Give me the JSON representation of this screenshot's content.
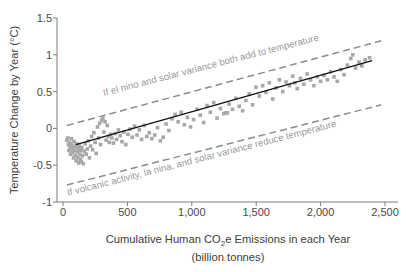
{
  "chart_data": {
    "type": "scatter",
    "title": "",
    "xlabel": "Cumulative Human CO2e Emissions in each Year (billion tonnes)",
    "xlabel_line1": "Cumulative Human CO",
    "xlabel_sub": "2",
    "xlabel_line1b": "e Emissions in each Year",
    "xlabel_line2": "(billion tonnes)",
    "ylabel": "Temperature Change by Year (°C)",
    "xlim": [
      0,
      2500
    ],
    "ylim": [
      -1,
      1.5
    ],
    "xticks": [
      0,
      500,
      1000,
      1500,
      2000,
      2500
    ],
    "xticklabels": [
      "0",
      "500",
      "1,000",
      "1,500",
      "2,000",
      "2,500"
    ],
    "yticks": [
      -1,
      -0.5,
      0,
      0.5,
      1,
      1.5
    ],
    "yticklabels": [
      "-1",
      "-0.5",
      "0",
      "0.5",
      "1",
      "1.5"
    ],
    "grid": false,
    "legend_position": "none",
    "series": [
      {
        "name": "Observed annual temperature change",
        "type": "scatter",
        "marker": "square",
        "color": "#a8a8a8",
        "points": [
          [
            30,
            -0.16
          ],
          [
            38,
            -0.13
          ],
          [
            42,
            -0.22
          ],
          [
            46,
            -0.3
          ],
          [
            50,
            -0.19
          ],
          [
            55,
            -0.26
          ],
          [
            58,
            -0.35
          ],
          [
            62,
            -0.21
          ],
          [
            66,
            -0.14
          ],
          [
            70,
            -0.28
          ],
          [
            74,
            -0.33
          ],
          [
            78,
            -0.24
          ],
          [
            82,
            -0.4
          ],
          [
            86,
            -0.18
          ],
          [
            90,
            -0.3
          ],
          [
            94,
            -0.37
          ],
          [
            98,
            -0.25
          ],
          [
            102,
            -0.44
          ],
          [
            106,
            -0.21
          ],
          [
            110,
            -0.32
          ],
          [
            114,
            -0.39
          ],
          [
            118,
            -0.27
          ],
          [
            122,
            -0.47
          ],
          [
            126,
            -0.23
          ],
          [
            130,
            -0.35
          ],
          [
            134,
            -0.42
          ],
          [
            138,
            -0.3
          ],
          [
            142,
            -0.45
          ],
          [
            146,
            -0.26
          ],
          [
            150,
            -0.37
          ],
          [
            158,
            -0.48
          ],
          [
            165,
            -0.31
          ],
          [
            172,
            -0.21
          ],
          [
            180,
            -0.35
          ],
          [
            188,
            -0.28
          ],
          [
            196,
            -0.17
          ],
          [
            205,
            -0.4
          ],
          [
            214,
            -0.24
          ],
          [
            222,
            -0.11
          ],
          [
            230,
            -0.29
          ],
          [
            240,
            -0.06
          ],
          [
            250,
            -0.19
          ],
          [
            258,
            -0.34
          ],
          [
            268,
            0.02
          ],
          [
            276,
            -0.13
          ],
          [
            285,
            0.07
          ],
          [
            292,
            -0.22
          ],
          [
            300,
            0.11
          ],
          [
            310,
            0.14
          ],
          [
            318,
            -0.05
          ],
          [
            326,
            0.09
          ],
          [
            335,
            -0.16
          ],
          [
            344,
            0.04
          ],
          [
            352,
            -0.11
          ],
          [
            360,
            -0.19
          ],
          [
            370,
            -0.08
          ],
          [
            380,
            -0.13
          ],
          [
            392,
            -0.2
          ],
          [
            404,
            -0.07
          ],
          [
            416,
            -0.15
          ],
          [
            430,
            -0.02
          ],
          [
            444,
            -0.1
          ],
          [
            458,
            -0.18
          ],
          [
            472,
            -0.05
          ],
          [
            488,
            -0.22
          ],
          [
            504,
            -0.08
          ],
          [
            520,
            -0.01
          ],
          [
            538,
            -0.12
          ],
          [
            556,
            0.03
          ],
          [
            574,
            -0.09
          ],
          [
            592,
            -0.02
          ],
          [
            610,
            -0.15
          ],
          [
            630,
            0.04
          ],
          [
            650,
            -0.11
          ],
          [
            670,
            -0.06
          ],
          [
            690,
            -0.14
          ],
          [
            712,
            -0.09
          ],
          [
            734,
            0.01
          ],
          [
            756,
            -0.17
          ],
          [
            778,
            -0.12
          ],
          [
            800,
            0.06
          ],
          [
            822,
            -0.03
          ],
          [
            846,
            0.13
          ],
          [
            870,
            0.19
          ],
          [
            894,
            0.09
          ],
          [
            918,
            0.22
          ],
          [
            942,
            0.05
          ],
          [
            966,
            0.15
          ],
          [
            990,
            0.02
          ],
          [
            1014,
            0.12
          ],
          [
            1040,
            0.26
          ],
          [
            1066,
            0.18
          ],
          [
            1092,
            0.08
          ],
          [
            1118,
            0.31
          ],
          [
            1144,
            0.22
          ],
          [
            1170,
            0.35
          ],
          [
            1196,
            0.14
          ],
          [
            1222,
            0.27
          ],
          [
            1248,
            0.2
          ],
          [
            1262,
            0.21
          ],
          [
            1276,
            0.21
          ],
          [
            1290,
            0.33
          ],
          [
            1316,
            0.26
          ],
          [
            1342,
            0.41
          ],
          [
            1368,
            0.3
          ],
          [
            1394,
            0.24
          ],
          [
            1420,
            0.38
          ],
          [
            1446,
            0.47
          ],
          [
            1472,
            0.32
          ],
          [
            1498,
            0.56
          ],
          [
            1524,
            0.44
          ],
          [
            1550,
            0.58
          ],
          [
            1576,
            0.49
          ],
          [
            1602,
            0.62
          ],
          [
            1628,
            0.4
          ],
          [
            1654,
            0.55
          ],
          [
            1680,
            0.66
          ],
          [
            1706,
            0.5
          ],
          [
            1732,
            0.63
          ],
          [
            1758,
            0.58
          ],
          [
            1784,
            0.71
          ],
          [
            1800,
            0.62
          ],
          [
            1818,
            0.54
          ],
          [
            1844,
            0.68
          ],
          [
            1870,
            0.6
          ],
          [
            1896,
            0.74
          ],
          [
            1922,
            0.66
          ],
          [
            1948,
            0.58
          ],
          [
            1974,
            0.7
          ],
          [
            2000,
            0.64
          ],
          [
            2026,
            0.72
          ],
          [
            2052,
            0.66
          ],
          [
            2078,
            0.77
          ],
          [
            2104,
            0.7
          ],
          [
            2130,
            0.64
          ],
          [
            2156,
            0.8
          ],
          [
            2182,
            0.73
          ],
          [
            2208,
            0.86
          ],
          [
            2234,
            0.95
          ],
          [
            2250,
            1.0
          ],
          [
            2272,
            0.82
          ],
          [
            2298,
            0.9
          ],
          [
            2320,
            0.85
          ],
          [
            2346,
            0.93
          ],
          [
            2380,
            0.96
          ]
        ]
      },
      {
        "name": "Trend line",
        "type": "line",
        "style": "solid",
        "color": "#111111",
        "x": [
          100,
          2400
        ],
        "y": [
          -0.22,
          0.92
        ]
      },
      {
        "name": "If el nino and solar variance both add to temperature",
        "type": "line",
        "style": "dashed",
        "color": "#8c8c8c",
        "x": [
          30,
          2470
        ],
        "y": [
          0.04,
          1.19
        ]
      },
      {
        "name": "If volcanic activity, la nina, and solar variance reduce temperature",
        "type": "line",
        "style": "dashed",
        "color": "#8c8c8c",
        "x": [
          30,
          2470
        ],
        "y": [
          -0.77,
          0.32
        ]
      }
    ],
    "annotations": [
      {
        "id": "upper-band-label",
        "text": "If el nino and solar variance both add to temperature",
        "color": "#9b9b9b"
      },
      {
        "id": "lower-band-label",
        "text": "If volcanic activity, la nina, and solar variance reduce temperature",
        "color": "#9b9b9b"
      }
    ]
  }
}
